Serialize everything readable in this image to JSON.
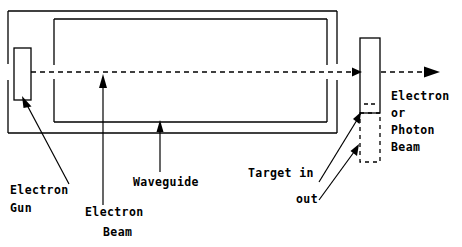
{
  "diagram": {
    "stroke_color": "#000000",
    "background_color": "#ffffff",
    "labels": {
      "electron_gun_line1": "Electron",
      "electron_gun_line2": "Gun",
      "electron_beam_line1": "Electron",
      "electron_beam_line2": "Beam",
      "waveguide": "Waveguide",
      "target_in": "Target in",
      "target_out": "out",
      "output_beam_line1": "Electron",
      "output_beam_line2": "or",
      "output_beam_line3": "Photon",
      "output_beam_line4": "Beam"
    },
    "parts": {
      "outer_housing": "accelerator housing",
      "waveguide_rect": "waveguide cavity",
      "electron_gun_box": "electron gun",
      "target_in_box": "target inserted",
      "target_out_box": "target retracted",
      "beam_axis": "dashed beam path"
    }
  }
}
